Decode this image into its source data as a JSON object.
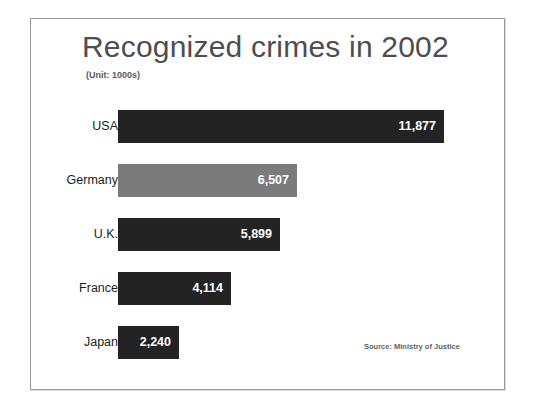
{
  "chart_data": {
    "type": "bar",
    "orientation": "horizontal",
    "title": "Recognized crimes in 2002",
    "subtitle": "(Unit: 1000s)",
    "xlabel": "",
    "ylabel": "",
    "grid": false,
    "legend": false,
    "xlim": [
      0,
      12000
    ],
    "source": "Source: Ministry of Justice",
    "categories": [
      "USA",
      "Germany",
      "U.K.",
      "France",
      "Japan"
    ],
    "values": [
      11877,
      6507,
      5899,
      4114,
      2240
    ],
    "value_labels": [
      "11,877",
      "6,507",
      "5,899",
      "4,114",
      "2,240"
    ],
    "bar_colors": [
      "#232323",
      "#7b7b7b",
      "#232323",
      "#232323",
      "#232323"
    ],
    "bars": [
      {
        "category": "USA",
        "value": 11877,
        "label": "11,877",
        "color": "#232323"
      },
      {
        "category": "Germany",
        "value": 6507,
        "label": "6,507",
        "color": "#7b7b7b"
      },
      {
        "category": "U.K.",
        "value": 5899,
        "label": "5,899",
        "color": "#232323"
      },
      {
        "category": "France",
        "value": 4114,
        "label": "4,114",
        "color": "#232323"
      },
      {
        "category": "Japan",
        "value": 2240,
        "label": "2,240",
        "color": "#232323"
      }
    ]
  },
  "colors": {
    "bar_dark": "#232323",
    "bar_light": "#7b7b7b",
    "title_text": "#4e4e4e",
    "label_text": "#1d1d1d",
    "value_text": "#ffffff",
    "frame_border": "#9a9a9a",
    "background": "#ffffff"
  }
}
